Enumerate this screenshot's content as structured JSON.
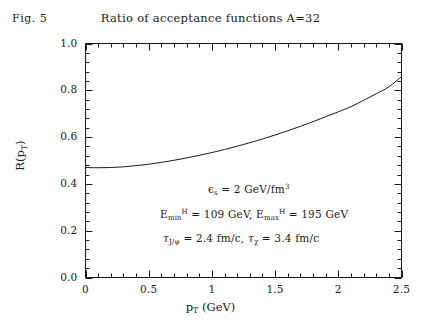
{
  "figure": {
    "fig_label": "Fig. 5",
    "title": "Ratio of acceptance functions A=32"
  },
  "axes": {
    "ylabel_prefix": "R(p",
    "ylabel_sub": "T",
    "ylabel_suffix": ")",
    "xlabel_prefix": "p",
    "xlabel_sub": "T",
    "xlabel_suffix": " (GeV)"
  },
  "annotations": {
    "line1": {
      "symbol": "ϵ",
      "sub": "s",
      "body": " = 2 GeV/fm",
      "sup": "3"
    },
    "line2": {
      "e_min": "E",
      "e_min_sub": "min",
      "e_min_sup": "H",
      "e_min_val": " = 109 GeV, ",
      "e_max": "E",
      "e_max_sub": "max",
      "e_max_sup": "H",
      "e_max_val": " = 195 GeV"
    },
    "line3": {
      "tau1": "τ",
      "tau1_sub": "J/ψ",
      "tau1_val": " = 2.4 fm/c, ",
      "tau2": "τ",
      "tau2_sub": "χ",
      "tau2_val": " = 3.4 fm/c"
    }
  },
  "chart_data": {
    "type": "line",
    "title": "Ratio of acceptance functions A=32",
    "xlabel": "p_T (GeV)",
    "ylabel": "R(p_T)",
    "xlim": [
      0,
      2.5
    ],
    "ylim": [
      0.0,
      1.0
    ],
    "grid": false,
    "legend": null,
    "xticks": [
      0,
      0.5,
      1,
      1.5,
      2,
      2.5
    ],
    "xtick_labels": [
      "0",
      "0.5",
      "1",
      "1.5",
      "2",
      "2.5"
    ],
    "yticks": [
      0.0,
      0.2,
      0.4,
      0.6,
      0.8,
      1.0
    ],
    "ytick_labels": [
      "0.0",
      "0.2",
      "0.4",
      "0.6",
      "0.8",
      "1.0"
    ],
    "minor_ticks_per_interval": 5,
    "tick_direction": "in",
    "frame": "full-box",
    "line_color": "#1a1a1a",
    "line_width": 1.0,
    "series": [
      {
        "name": "R(p_T)",
        "x": [
          0.0,
          0.1,
          0.2,
          0.3,
          0.4,
          0.5,
          0.6,
          0.7,
          0.8,
          0.9,
          1.0,
          1.1,
          1.2,
          1.3,
          1.4,
          1.5,
          1.6,
          1.7,
          1.8,
          1.9,
          2.0,
          2.1,
          2.2,
          2.3,
          2.4,
          2.5
        ],
        "y": [
          0.47,
          0.469,
          0.47,
          0.473,
          0.478,
          0.484,
          0.492,
          0.501,
          0.511,
          0.522,
          0.534,
          0.547,
          0.561,
          0.576,
          0.592,
          0.609,
          0.627,
          0.646,
          0.666,
          0.687,
          0.708,
          0.73,
          0.757,
          0.785,
          0.815,
          0.858
        ]
      }
    ],
    "annotations": [
      "ϵ_s = 2 GeV/fm³",
      "E_min^H = 109 GeV, E_max^H = 195 GeV",
      "τ_J/ψ = 2.4 fm/c, τ_χ = 3.4 fm/c"
    ]
  }
}
